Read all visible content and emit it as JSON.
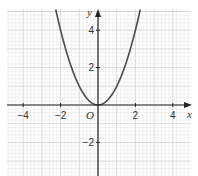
{
  "chart_data": {
    "type": "line",
    "title": "",
    "function": "y = x^2",
    "xlabel": "x",
    "ylabel": "y",
    "origin_label": "O",
    "xlim": [
      -4.9,
      5.0
    ],
    "ylim": [
      -3.8,
      5.1
    ],
    "x_ticks": [
      -4,
      -2,
      2,
      4
    ],
    "x_tick_labels": [
      "−4",
      "−2",
      "2",
      "4"
    ],
    "y_ticks": [
      4,
      2,
      -2
    ],
    "y_tick_labels": [
      "4",
      "2",
      "−2"
    ],
    "grid": true,
    "grid_minor_step": 0.2,
    "grid_major_step": 1,
    "series": [
      {
        "name": "y = x^2",
        "x": [
          -2.2,
          -2,
          -1.5,
          -1,
          -0.5,
          0,
          0.5,
          1,
          1.5,
          2,
          2.2
        ],
        "y": [
          4.84,
          4,
          2.25,
          1,
          0.25,
          0,
          0.25,
          1,
          2.25,
          4,
          4.84
        ]
      }
    ],
    "legend": null
  },
  "colors": {
    "curve": "#4a4a4a",
    "axis": "#222222",
    "grid_minor": "#e4e4e4",
    "grid_major": "#cfcfcf",
    "background": "#ffffff"
  }
}
